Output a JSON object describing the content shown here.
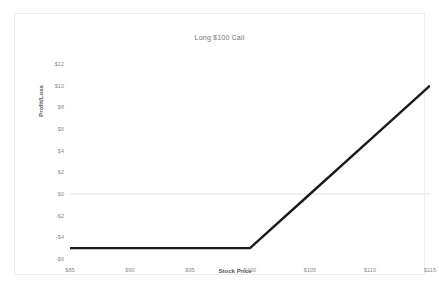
{
  "chart_data": {
    "type": "line",
    "title": "Long $100 Call",
    "xlabel": "Stock Price",
    "ylabel": "Profit/Loss",
    "x": [
      85,
      90,
      95,
      100,
      105,
      110,
      115
    ],
    "values": [
      -5,
      -5,
      -5,
      -5,
      0,
      5,
      10
    ],
    "series": [
      {
        "name": "Long $100 Call",
        "values": [
          -5,
          -5,
          -5,
          -5,
          0,
          5,
          10
        ],
        "color": "#1a1a1a"
      }
    ],
    "xticklabels": [
      "$85",
      "$90",
      "$95",
      "$100",
      "$105",
      "$110",
      "$115"
    ],
    "xtickvalues": [
      85,
      90,
      95,
      100,
      105,
      110,
      115
    ],
    "yticklabels": [
      "$12",
      "$10",
      "$8",
      "$6",
      "$4",
      "$2",
      "$0",
      "-$2",
      "-$4",
      "-$6"
    ],
    "ytickvalues": [
      12,
      10,
      8,
      6,
      4,
      2,
      0,
      -2,
      -4,
      -6
    ],
    "xlim": [
      85,
      115
    ],
    "ylim": [
      -6,
      12
    ],
    "grid": "horizontal-zero-only",
    "gridlines": [
      0
    ],
    "gridline_color": "#d9d9d9",
    "legend": "none",
    "annotations": {
      "strike": 100,
      "premium": 5,
      "breakeven": 105,
      "max_loss": -5
    }
  },
  "frame": {
    "border_color": "#eceff1",
    "background": "#ffffff"
  },
  "text_colors": {
    "title": "#7a7a7a",
    "axis_title": "#555555",
    "tick": "#8d8d8d"
  }
}
